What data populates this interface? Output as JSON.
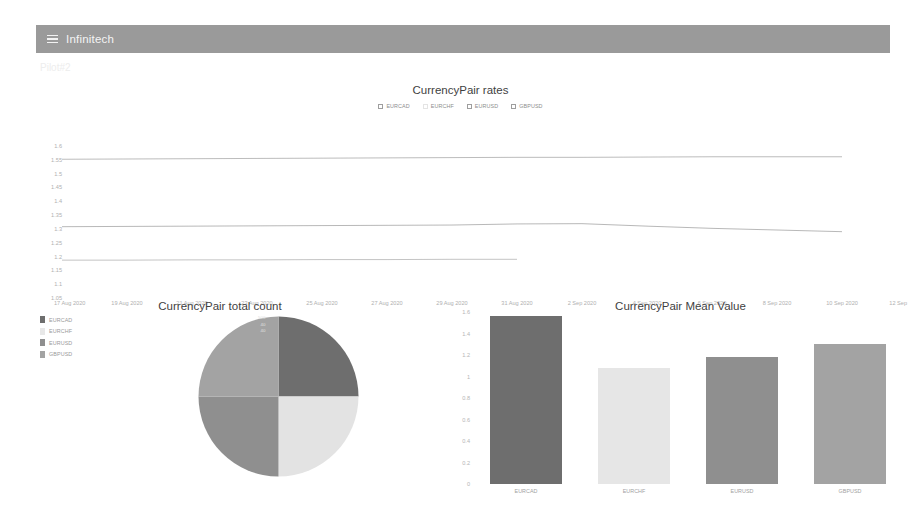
{
  "header": {
    "menu_icon": "hamburger-icon",
    "brand": "Infinitech",
    "background": "#9a9a9a"
  },
  "page_label": "Pilot#2",
  "line_chart": {
    "title": "CurrencyPair rates",
    "legend": [
      {
        "label": "EURCAD",
        "checked": false,
        "faint": false
      },
      {
        "label": "EURCHF",
        "checked": false,
        "faint": true
      },
      {
        "label": "EURUSD",
        "checked": false,
        "faint": false
      },
      {
        "label": "GBPUSD",
        "checked": false,
        "faint": false
      }
    ]
  },
  "pie_chart": {
    "title": "CurrencyPair total count",
    "legend": [
      {
        "label": "EURCAD",
        "color": "#6e6e6e"
      },
      {
        "label": "EURCHF",
        "color": "#e3e3e3"
      },
      {
        "label": "EURUSD",
        "color": "#8f8f8f"
      },
      {
        "label": "GBPUSD",
        "color": "#a3a3a3"
      }
    ],
    "edge_ticks": [
      "500",
      "40",
      "40"
    ]
  },
  "bar_chart": {
    "title": "CurrencyPair Mean Value"
  },
  "chart_data": [
    {
      "type": "line",
      "title": "CurrencyPair rates",
      "xlabel": "",
      "ylabel": "",
      "ylim": [
        1.05,
        1.6
      ],
      "yticks": [
        1.6,
        1.55,
        1.5,
        1.45,
        1.4,
        1.35,
        1.3,
        1.25,
        1.2,
        1.15,
        1.1,
        1.05
      ],
      "ytick_labels": [
        "1.6",
        "1.55",
        "1.5",
        "1.45",
        "1.4",
        "1.35",
        "1.3",
        "1.25",
        "1.2",
        "1.15",
        "1.1",
        "1.05"
      ],
      "x": [
        "17 Aug 2020",
        "19 Aug 2020",
        "21 Aug 2020",
        "23 Aug 2020",
        "25 Aug 2020",
        "27 Aug 2020",
        "29 Aug 2020",
        "31 Aug 2020",
        "2 Sep 2020",
        "4 Sep 2020",
        "6 Sep 2020",
        "8 Sep 2020",
        "10 Sep 2020",
        "12 Sep"
      ],
      "grid": false,
      "legend_position": "top",
      "series": [
        {
          "name": "EURCAD",
          "color": "#b4b4b4",
          "values": [
            1.552,
            1.553,
            1.554,
            1.555,
            1.556,
            1.557,
            1.558,
            1.559,
            1.559,
            1.56,
            1.561,
            1.561,
            1.561,
            null
          ]
        },
        {
          "name": "EURCHF",
          "color": "#e0e0e0",
          "values": [
            null,
            null,
            null,
            null,
            null,
            null,
            null,
            null,
            null,
            null,
            null,
            null,
            null,
            null
          ]
        },
        {
          "name": "EURUSD",
          "color": "#bdbdbd",
          "values": [
            1.187,
            1.187,
            1.188,
            1.188,
            1.189,
            1.189,
            1.19,
            1.19,
            null,
            null,
            null,
            null,
            null,
            null
          ]
        },
        {
          "name": "GBPUSD",
          "color": "#b0b0b0",
          "values": [
            1.308,
            1.309,
            1.31,
            1.311,
            1.312,
            1.313,
            1.314,
            1.318,
            1.319,
            1.31,
            1.302,
            1.296,
            1.29,
            null
          ]
        }
      ]
    },
    {
      "type": "pie",
      "title": "CurrencyPair total count",
      "labels": [
        "EURCAD",
        "EURCHF",
        "EURUSD",
        "GBPUSD"
      ],
      "values": [
        25,
        25,
        25,
        25
      ],
      "colors": [
        "#6e6e6e",
        "#e3e3e3",
        "#8f8f8f",
        "#a3a3a3"
      ],
      "legend_position": "left"
    },
    {
      "type": "bar",
      "title": "CurrencyPair Mean Value",
      "categories": [
        "EURCAD",
        "EURCHF",
        "EURUSD",
        "GBPUSD"
      ],
      "values": [
        1.56,
        1.08,
        1.185,
        1.3
      ],
      "colors": [
        "#6e6e6e",
        "#e6e6e6",
        "#8f8f8f",
        "#a3a3a3"
      ],
      "xlabel": "",
      "ylabel": "",
      "ylim": [
        0,
        1.6
      ],
      "yticks": [
        1.6,
        1.4,
        1.2,
        1.0,
        0.8,
        0.6,
        0.4,
        0.2,
        0
      ],
      "ytick_labels": [
        "1.6",
        "1.4",
        "1.2",
        "1",
        "0.8",
        "0.6",
        "0.4",
        "0.2",
        "0"
      ],
      "grid": false
    }
  ]
}
